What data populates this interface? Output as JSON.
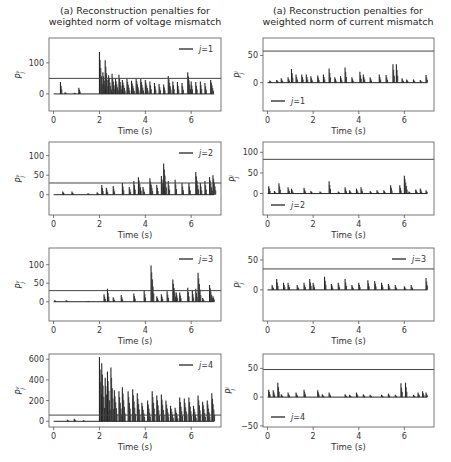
{
  "titles": {
    "left": [
      "(a) Reconstruction penalties for",
      "weighted norm of voltage mismatch"
    ],
    "right": [
      "(a) Reconstruction penalties for",
      "weighted norm of current mismatch"
    ]
  },
  "chart_data": [
    {
      "type": "bar",
      "panel": "left-1",
      "title": "(a) Reconstruction penalties for weighted norm of voltage mismatch",
      "xlabel": "Time (s)",
      "ylabel": "P_j^v",
      "legend": "j=1",
      "legend_position": "upper right",
      "xlim": [
        -0.2,
        7.3
      ],
      "ylim": [
        -55,
        180
      ],
      "xticks": [
        0,
        2,
        4,
        6
      ],
      "yticks": [
        0,
        100
      ],
      "threshold": 50,
      "spikes": [
        [
          0.3,
          38
        ],
        [
          0.5,
          5
        ],
        [
          0.9,
          4
        ],
        [
          1.1,
          20
        ],
        [
          2.0,
          135
        ],
        [
          2.15,
          70
        ],
        [
          2.25,
          108
        ],
        [
          2.4,
          60
        ],
        [
          2.55,
          65
        ],
        [
          2.7,
          50
        ],
        [
          2.85,
          62
        ],
        [
          3.0,
          45
        ],
        [
          3.2,
          48
        ],
        [
          3.4,
          42
        ],
        [
          3.6,
          50
        ],
        [
          3.8,
          48
        ],
        [
          4.0,
          45
        ],
        [
          4.2,
          40
        ],
        [
          4.4,
          35
        ],
        [
          4.6,
          32
        ],
        [
          4.8,
          30
        ],
        [
          5.0,
          58
        ],
        [
          5.2,
          40
        ],
        [
          5.4,
          38
        ],
        [
          5.6,
          35
        ],
        [
          5.85,
          70
        ],
        [
          6.0,
          40
        ],
        [
          6.2,
          38
        ],
        [
          6.4,
          40
        ],
        [
          6.6,
          35
        ],
        [
          6.85,
          45
        ]
      ]
    },
    {
      "type": "bar",
      "panel": "right-1",
      "title": "(a) Reconstruction penalties for weighted norm of current mismatch",
      "xlabel": "Time (s)",
      "ylabel": "P_j^i",
      "legend": "j=1",
      "legend_position": "lower left",
      "xlim": [
        -0.2,
        7.3
      ],
      "ylim": [
        -52,
        82
      ],
      "xticks": [
        0,
        2,
        4,
        6
      ],
      "yticks": [
        0,
        50
      ],
      "threshold": 58,
      "spikes": [
        [
          0.1,
          4
        ],
        [
          0.4,
          5
        ],
        [
          0.6,
          8
        ],
        [
          0.9,
          10
        ],
        [
          1.05,
          25
        ],
        [
          1.25,
          15
        ],
        [
          1.5,
          15
        ],
        [
          1.7,
          15
        ],
        [
          1.9,
          12
        ],
        [
          2.2,
          13
        ],
        [
          2.45,
          15
        ],
        [
          2.7,
          26
        ],
        [
          2.95,
          10
        ],
        [
          3.2,
          12
        ],
        [
          3.4,
          28
        ],
        [
          3.7,
          10
        ],
        [
          4.05,
          20
        ],
        [
          4.2,
          15
        ],
        [
          4.5,
          10
        ],
        [
          4.9,
          15
        ],
        [
          5.2,
          14
        ],
        [
          5.5,
          34
        ],
        [
          5.65,
          34
        ],
        [
          5.9,
          8
        ],
        [
          6.1,
          6
        ],
        [
          6.4,
          6
        ],
        [
          6.7,
          5
        ],
        [
          6.95,
          14
        ]
      ]
    },
    {
      "type": "bar",
      "panel": "left-2",
      "xlabel": "Time (s)",
      "ylabel": "P_j^v",
      "legend": "j=2",
      "legend_position": "upper right",
      "xlim": [
        -0.2,
        7.3
      ],
      "ylim": [
        -52,
        135
      ],
      "xticks": [
        0,
        2,
        4,
        6
      ],
      "yticks": [
        0,
        50,
        100
      ],
      "threshold": 30,
      "spikes": [
        [
          0.4,
          8
        ],
        [
          0.8,
          8
        ],
        [
          1.5,
          4
        ],
        [
          1.9,
          6
        ],
        [
          2.1,
          25
        ],
        [
          2.3,
          18
        ],
        [
          2.6,
          22
        ],
        [
          3.0,
          30
        ],
        [
          3.3,
          20
        ],
        [
          3.5,
          35
        ],
        [
          3.7,
          45
        ],
        [
          3.9,
          20
        ],
        [
          4.2,
          42
        ],
        [
          4.5,
          25
        ],
        [
          4.7,
          48
        ],
        [
          4.8,
          80
        ],
        [
          5.0,
          35
        ],
        [
          5.3,
          38
        ],
        [
          5.6,
          30
        ],
        [
          5.9,
          30
        ],
        [
          6.2,
          58
        ],
        [
          6.4,
          30
        ],
        [
          6.6,
          35
        ],
        [
          6.8,
          45
        ],
        [
          6.95,
          50
        ]
      ]
    },
    {
      "type": "bar",
      "panel": "right-2",
      "xlabel": "Time (s)",
      "ylabel": "P_j^i",
      "legend": "j=2",
      "legend_position": "lower left",
      "xlim": [
        -0.2,
        7.3
      ],
      "ylim": [
        -52,
        125
      ],
      "xticks": [
        0,
        2,
        4,
        6
      ],
      "yticks": [
        0,
        50,
        100
      ],
      "threshold": 83,
      "spikes": [
        [
          0.05,
          18
        ],
        [
          0.3,
          6
        ],
        [
          0.5,
          25
        ],
        [
          0.9,
          15
        ],
        [
          1.05,
          12
        ],
        [
          1.6,
          14
        ],
        [
          1.9,
          6
        ],
        [
          2.3,
          5
        ],
        [
          2.7,
          30
        ],
        [
          3.1,
          5
        ],
        [
          3.4,
          15
        ],
        [
          3.6,
          8
        ],
        [
          3.9,
          12
        ],
        [
          4.1,
          15
        ],
        [
          4.5,
          6
        ],
        [
          4.8,
          8
        ],
        [
          5.1,
          8
        ],
        [
          5.4,
          20
        ],
        [
          5.8,
          20
        ],
        [
          6.0,
          43
        ],
        [
          6.2,
          5
        ],
        [
          6.5,
          10
        ],
        [
          6.7,
          12
        ],
        [
          6.95,
          8
        ]
      ]
    },
    {
      "type": "bar",
      "panel": "left-3",
      "xlabel": "Time (s)",
      "ylabel": "P_j^v",
      "legend": "j=3",
      "legend_position": "upper right",
      "xlim": [
        -0.2,
        7.3
      ],
      "ylim": [
        -52,
        145
      ],
      "xticks": [
        0,
        2,
        4,
        6
      ],
      "yticks": [
        0,
        50,
        100
      ],
      "threshold": 30,
      "spikes": [
        [
          0.05,
          4
        ],
        [
          0.55,
          4
        ],
        [
          1.5,
          2
        ],
        [
          2.2,
          20
        ],
        [
          2.35,
          35
        ],
        [
          2.6,
          12
        ],
        [
          2.95,
          18
        ],
        [
          3.5,
          22
        ],
        [
          3.95,
          30
        ],
        [
          4.25,
          98
        ],
        [
          4.5,
          15
        ],
        [
          4.7,
          20
        ],
        [
          4.95,
          28
        ],
        [
          5.2,
          60
        ],
        [
          5.35,
          25
        ],
        [
          5.5,
          25
        ],
        [
          5.85,
          38
        ],
        [
          6.05,
          30
        ],
        [
          6.2,
          35
        ],
        [
          6.3,
          78
        ],
        [
          6.5,
          10
        ],
        [
          6.8,
          45
        ],
        [
          6.95,
          15
        ]
      ]
    },
    {
      "type": "bar",
      "panel": "right-3",
      "xlabel": "Time (s)",
      "ylabel": "P_j^i",
      "legend": "j=3",
      "legend_position": "upper right",
      "xlim": [
        -0.2,
        7.3
      ],
      "ylim": [
        -52,
        70
      ],
      "xticks": [
        0,
        2,
        4,
        6
      ],
      "yticks": [
        0,
        50
      ],
      "threshold": 35,
      "spikes": [
        [
          0.2,
          8
        ],
        [
          0.4,
          18
        ],
        [
          0.7,
          12
        ],
        [
          0.9,
          12
        ],
        [
          1.3,
          8
        ],
        [
          1.6,
          12
        ],
        [
          1.85,
          18
        ],
        [
          2.0,
          12
        ],
        [
          2.5,
          22
        ],
        [
          2.8,
          10
        ],
        [
          3.1,
          12
        ],
        [
          3.4,
          18
        ],
        [
          3.7,
          8
        ],
        [
          4.0,
          12
        ],
        [
          4.4,
          16
        ],
        [
          4.7,
          15
        ],
        [
          5.0,
          12
        ],
        [
          5.3,
          10
        ],
        [
          5.6,
          8
        ],
        [
          6.0,
          6
        ],
        [
          6.3,
          8
        ],
        [
          6.95,
          20
        ]
      ]
    },
    {
      "type": "bar",
      "panel": "left-4",
      "xlabel": "Time (s)",
      "ylabel": "P_j^v",
      "legend": "j=4",
      "legend_position": "upper right",
      "xlim": [
        -0.2,
        7.3
      ],
      "ylim": [
        -55,
        650
      ],
      "xticks": [
        0,
        2,
        4,
        6
      ],
      "yticks": [
        0,
        200,
        400,
        600
      ],
      "threshold": 60,
      "spikes": [
        [
          0.6,
          15
        ],
        [
          0.9,
          25
        ],
        [
          1.3,
          10
        ],
        [
          2.0,
          620
        ],
        [
          2.1,
          560
        ],
        [
          2.25,
          420
        ],
        [
          2.35,
          480
        ],
        [
          2.5,
          520
        ],
        [
          2.65,
          300
        ],
        [
          2.85,
          290
        ],
        [
          3.0,
          330
        ],
        [
          3.25,
          290
        ],
        [
          3.45,
          310
        ],
        [
          3.65,
          270
        ],
        [
          3.85,
          180
        ],
        [
          4.1,
          200
        ],
        [
          4.3,
          290
        ],
        [
          4.5,
          250
        ],
        [
          4.7,
          260
        ],
        [
          4.9,
          200
        ],
        [
          5.1,
          150
        ],
        [
          5.3,
          130
        ],
        [
          5.5,
          230
        ],
        [
          5.7,
          220
        ],
        [
          5.9,
          230
        ],
        [
          6.1,
          150
        ],
        [
          6.3,
          250
        ],
        [
          6.5,
          190
        ],
        [
          6.7,
          200
        ],
        [
          6.9,
          270
        ]
      ]
    },
    {
      "type": "bar",
      "panel": "right-4",
      "xlabel": "Time (s)",
      "ylabel": "P_j^i",
      "legend": "j=4",
      "legend_position": "lower left",
      "xlim": [
        -0.2,
        7.3
      ],
      "ylim": [
        -52,
        75
      ],
      "xticks": [
        0,
        2,
        4,
        6
      ],
      "yticks": [
        -50,
        0,
        50
      ],
      "threshold": 48,
      "spikes": [
        [
          0.05,
          13
        ],
        [
          0.25,
          12
        ],
        [
          0.45,
          25
        ],
        [
          0.6,
          5
        ],
        [
          0.9,
          8
        ],
        [
          1.25,
          8
        ],
        [
          1.6,
          13
        ],
        [
          2.2,
          12
        ],
        [
          2.4,
          5
        ],
        [
          2.7,
          8
        ],
        [
          3.4,
          5
        ],
        [
          3.6,
          4
        ],
        [
          3.9,
          8
        ],
        [
          4.2,
          5
        ],
        [
          4.5,
          4
        ],
        [
          5.0,
          4
        ],
        [
          5.3,
          6
        ],
        [
          5.6,
          4
        ],
        [
          5.85,
          24
        ],
        [
          6.05,
          25
        ],
        [
          6.4,
          4
        ],
        [
          6.6,
          8
        ],
        [
          6.8,
          10
        ],
        [
          6.95,
          8
        ]
      ]
    }
  ],
  "axis": {
    "xlabel": "Time (s)"
  },
  "colors": {
    "line": "#262626",
    "axes": "#666666",
    "text": "#262626"
  }
}
